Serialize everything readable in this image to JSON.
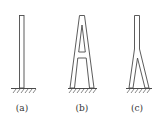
{
  "diagram": {
    "figures": [
      {
        "id": "a",
        "label": "(a)",
        "shape": "single-column",
        "description": "Single vertical column fixed at ground"
      },
      {
        "id": "b",
        "label": "(b)",
        "shape": "A-shaped",
        "description": "A-shaped tower with crossbeam, fixed at ground"
      },
      {
        "id": "c",
        "label": "(c)",
        "shape": "inverted-Y",
        "description": "Inverted Y-shaped tower, single column splitting into two legs"
      }
    ],
    "colors": {
      "line": "#4a4a4a",
      "background": "#ffffff",
      "label": "#333333"
    }
  }
}
